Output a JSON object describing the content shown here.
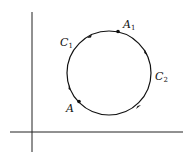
{
  "diagram": {
    "labels": {
      "A1": {
        "main": "A",
        "sub": "1"
      },
      "C1": {
        "main": "C",
        "sub": "1"
      },
      "C2": {
        "main": "C",
        "sub": "2"
      },
      "A": {
        "main": "A"
      }
    },
    "colors": {
      "stroke": "#111111",
      "background": "#ffffff"
    }
  }
}
